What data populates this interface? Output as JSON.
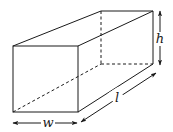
{
  "diagram": {
    "type": "rectangular-prism",
    "labels": {
      "width": "w",
      "length": "l",
      "height": "h"
    },
    "colors": {
      "stroke": "#1a1a1a",
      "background": "#ffffff"
    },
    "vertices": {
      "front_top_left": [
        13,
        46
      ],
      "front_top_right": [
        78,
        46
      ],
      "front_bottom_left": [
        13,
        112
      ],
      "front_bottom_right": [
        78,
        112
      ],
      "back_top_left": [
        101,
        11
      ],
      "back_top_right": [
        153,
        11
      ],
      "back_bottom_left": [
        101,
        64
      ],
      "back_bottom_right": [
        153,
        64
      ]
    },
    "dimensions": [
      {
        "name": "width",
        "label": "w",
        "from": [
          13,
          123
        ],
        "to": [
          77,
          123
        ],
        "label_pos": [
          48,
          127
        ]
      },
      {
        "name": "length",
        "label": "l",
        "from": [
          81,
          122
        ],
        "to": [
          156,
          73
        ],
        "label_pos": [
          117,
          102
        ]
      },
      {
        "name": "height",
        "label": "h",
        "from": [
          160,
          11
        ],
        "to": [
          160,
          65
        ],
        "label_pos": [
          160,
          43
        ]
      }
    ]
  }
}
